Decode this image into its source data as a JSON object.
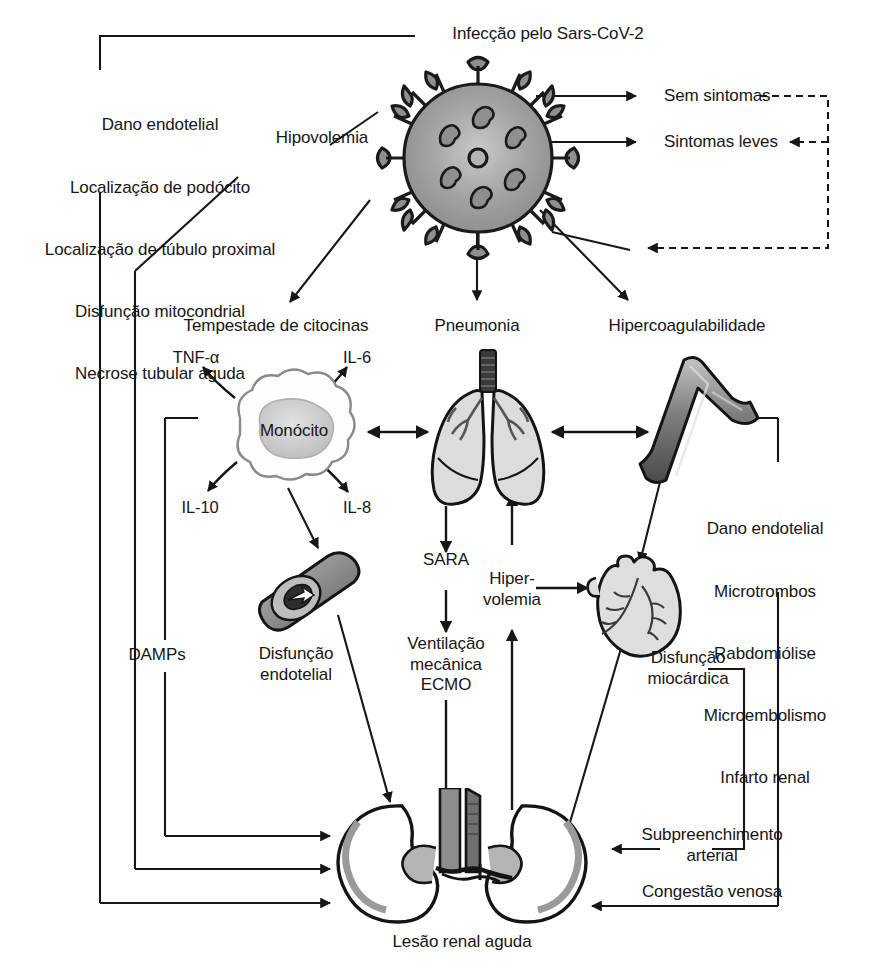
{
  "diagram": {
    "title": "Infecção pelo Sars-CoV-2",
    "caption": "Lesão renal aguda",
    "colors": {
      "line": "#161616",
      "text": "#161616",
      "virus_fill": "#9a9a9a",
      "organ_fill": "#d6d6d6",
      "background": "#ffffff"
    }
  },
  "nodes": {
    "infection": "Infecção pelo Sars-CoV-2",
    "no_symptoms": "Sem sintomas",
    "mild_symptoms": "Sintomas leves",
    "hypovolemia": "Hipovolemia",
    "cytokine_storm": "Tempestade de citocinas",
    "pneumonia": "Pneumonia",
    "hypercoagulability": "Hipercoagulabilidade",
    "monocyte": "Monócito",
    "sara": "SARA",
    "mechanical_ventilation": "Ventilação\nmecânica\nECMO",
    "hypervolemia": "Hiper-\nvolemia",
    "endothelial_dysfunction": "Disfunção\nendotelial",
    "myocardial_dysfunction": "Disfunção\nmiocárdica",
    "damps": "DAMPs",
    "arterial_underfilling": "Subpreenchimento\narterial",
    "venous_congestion": "Congestão venosa",
    "acute_kidney_injury": "Lesão renal aguda"
  },
  "cytokines": {
    "tnf_alpha": "TNF-α",
    "il_6": "IL-6",
    "il_10": "IL-10",
    "il_8": "IL-8"
  },
  "left_mechanisms": {
    "lines": [
      "Dano endotelial",
      "Localização de podócito",
      "Localização de túbulo proximal",
      "Disfunção mitocondrial",
      "Necrose tubular aguda"
    ]
  },
  "right_mechanisms": {
    "lines": [
      "Dano endotelial",
      "Microtrombos",
      "Rabdomiólise",
      "Microembolismo",
      "Infarto renal"
    ]
  }
}
